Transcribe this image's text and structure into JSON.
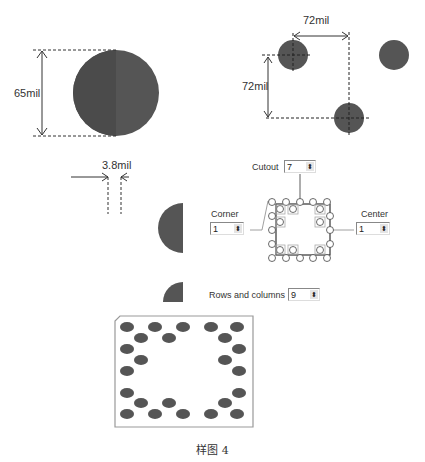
{
  "top_strip": "",
  "dimensions": {
    "pad_diameter": "65mil",
    "pitch_horizontal": "72mil",
    "pitch_vertical": "72mil",
    "clearance": "3.8mil"
  },
  "controls": {
    "cutout": {
      "label": "Cutout",
      "value": "7"
    },
    "corner": {
      "label": "Corner",
      "value": "1"
    },
    "center": {
      "label": "Center",
      "value": "1"
    },
    "rows_columns": {
      "label": "Rows and columns",
      "value": "9"
    }
  },
  "spin_glyph": "⬍",
  "caption": "样图 4",
  "colors": {
    "pad": "#555555",
    "pad_dark": "#4a4a4a",
    "line": "#333333",
    "outline": "#999999"
  }
}
